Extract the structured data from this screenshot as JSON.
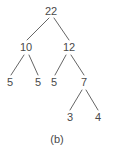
{
  "figure": {
    "caption": "(b)",
    "caption_x": 57,
    "caption_y": 139,
    "background_color": "#ffffff",
    "text_color": "#4a4a4a",
    "edge_color": "#666666",
    "width": 114,
    "height": 153
  },
  "chart_data": {
    "type": "diagram",
    "diagram_kind": "binary-tree",
    "title": "(b)",
    "xlabel": "",
    "ylabel": "",
    "grid": false,
    "legend": "none",
    "nodes": [
      {
        "id": "n0",
        "label": "22",
        "x": 51,
        "y": 11,
        "level": 0
      },
      {
        "id": "n1",
        "label": "10",
        "x": 26,
        "y": 47,
        "level": 1
      },
      {
        "id": "n2",
        "label": "12",
        "x": 69,
        "y": 47,
        "level": 1
      },
      {
        "id": "n3",
        "label": "5",
        "x": 10,
        "y": 82,
        "level": 2
      },
      {
        "id": "n4",
        "label": "5",
        "x": 38,
        "y": 82,
        "level": 2
      },
      {
        "id": "n5",
        "label": "5",
        "x": 54,
        "y": 82,
        "level": 2
      },
      {
        "id": "n6",
        "label": "7",
        "x": 84,
        "y": 82,
        "level": 2
      },
      {
        "id": "n7",
        "label": "3",
        "x": 70,
        "y": 117,
        "level": 3
      },
      {
        "id": "n8",
        "label": "4",
        "x": 98,
        "y": 117,
        "level": 3
      }
    ],
    "edges": [
      {
        "from": "n0",
        "to": "n1",
        "x1": 49,
        "y1": 18,
        "x2": 27,
        "y2": 40
      },
      {
        "from": "n0",
        "to": "n2",
        "x1": 54,
        "y1": 18,
        "x2": 69,
        "y2": 40
      },
      {
        "from": "n1",
        "to": "n3",
        "x1": 24,
        "y1": 55,
        "x2": 11,
        "y2": 75
      },
      {
        "from": "n1",
        "to": "n4",
        "x1": 29,
        "y1": 55,
        "x2": 38,
        "y2": 75
      },
      {
        "from": "n2",
        "to": "n5",
        "x1": 66,
        "y1": 55,
        "x2": 55,
        "y2": 75
      },
      {
        "from": "n2",
        "to": "n6",
        "x1": 71,
        "y1": 55,
        "x2": 84,
        "y2": 75
      },
      {
        "from": "n6",
        "to": "n7",
        "x1": 82,
        "y1": 90,
        "x2": 70,
        "y2": 110
      },
      {
        "from": "n6",
        "to": "n8",
        "x1": 86,
        "y1": 90,
        "x2": 98,
        "y2": 110
      }
    ]
  }
}
